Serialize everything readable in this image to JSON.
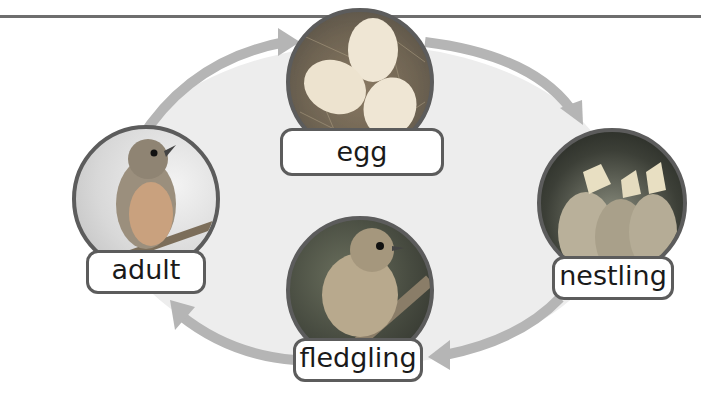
{
  "diagram": {
    "colors": {
      "arrow": "#b5b5b5",
      "fill": "#ececec",
      "border": "#5c5c5c",
      "rule": "#6e6e6e"
    },
    "stages": [
      {
        "id": "egg",
        "label": "egg",
        "icon": "eggs-in-nest-photo"
      },
      {
        "id": "nestling",
        "label": "nestling",
        "icon": "baby-birds-photo"
      },
      {
        "id": "fledgling",
        "label": "fledgling",
        "icon": "young-bird-photo"
      },
      {
        "id": "adult",
        "label": "adult",
        "icon": "adult-bird-photo"
      }
    ],
    "arrows": [
      {
        "from": "adult",
        "to": "egg"
      },
      {
        "from": "egg",
        "to": "nestling"
      },
      {
        "from": "nestling",
        "to": "fledgling"
      },
      {
        "from": "fledgling",
        "to": "adult"
      }
    ]
  }
}
